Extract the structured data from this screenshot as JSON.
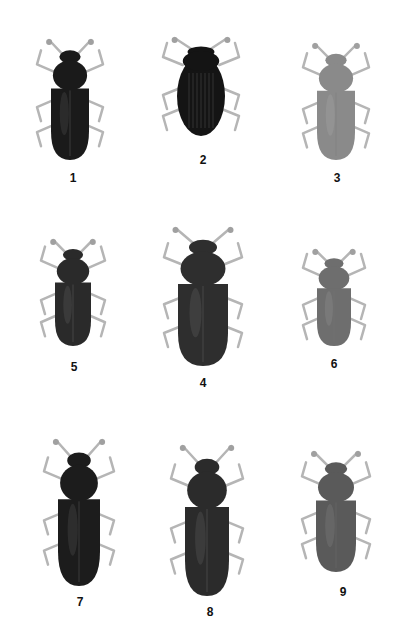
{
  "plate": {
    "background": "#ffffff",
    "specimens": [
      {
        "number": "1",
        "label_x": 73,
        "label_y": 171,
        "cx": 70,
        "top": 40,
        "len": 120,
        "width": 38,
        "color": "#1a1a1a",
        "shape": "elongate"
      },
      {
        "number": "2",
        "label_x": 203,
        "label_y": 153,
        "cx": 201,
        "top": 38,
        "len": 100,
        "width": 48,
        "color": "#141414",
        "shape": "oval"
      },
      {
        "number": "3",
        "label_x": 337,
        "label_y": 171,
        "cx": 336,
        "top": 44,
        "len": 116,
        "width": 38,
        "color": "#8a8a8a",
        "shape": "elongate"
      },
      {
        "number": "5",
        "label_x": 74,
        "label_y": 360,
        "cx": 73,
        "top": 240,
        "len": 106,
        "width": 36,
        "color": "#2a2a2a",
        "shape": "elongate"
      },
      {
        "number": "4",
        "label_x": 203,
        "label_y": 376,
        "cx": 203,
        "top": 228,
        "len": 138,
        "width": 50,
        "color": "#2e2e2e",
        "shape": "elongate"
      },
      {
        "number": "6",
        "label_x": 334,
        "label_y": 357,
        "cx": 334,
        "top": 250,
        "len": 96,
        "width": 34,
        "color": "#6e6e6e",
        "shape": "elongate"
      },
      {
        "number": "7",
        "label_x": 80,
        "label_y": 595,
        "cx": 79,
        "top": 440,
        "len": 146,
        "width": 42,
        "color": "#1c1c1c",
        "shape": "elongate"
      },
      {
        "number": "8",
        "label_x": 210,
        "label_y": 605,
        "cx": 207,
        "top": 446,
        "len": 150,
        "width": 44,
        "color": "#2b2b2b",
        "shape": "elongate"
      },
      {
        "number": "9",
        "label_x": 343,
        "label_y": 585,
        "cx": 336,
        "top": 452,
        "len": 120,
        "width": 40,
        "color": "#5a5a5a",
        "shape": "elongate"
      }
    ]
  }
}
